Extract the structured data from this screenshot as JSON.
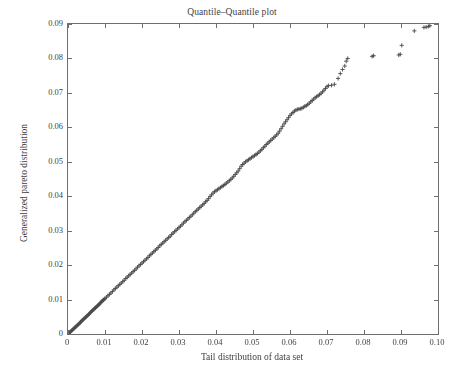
{
  "chart_data": {
    "type": "scatter",
    "title": "Quantile–Quantile plot",
    "xlabel": "Tail distribution of data set",
    "ylabel": "Generalized pareto distribution",
    "xlim": [
      0,
      0.1
    ],
    "ylim": [
      0,
      0.09
    ],
    "grid": false,
    "legend": null,
    "marker": "plus",
    "marker_color": "#4a4a4a",
    "axis_color": "#6e6e6e",
    "background": "#ffffff",
    "xticks": [
      0,
      0.01,
      0.02,
      0.03,
      0.04,
      0.05,
      0.06,
      0.07,
      0.08,
      0.09,
      0.1
    ],
    "xtick_labels": [
      "0",
      "0.01",
      "0.02",
      "0.03",
      "0.04",
      "0.05",
      "0.06",
      "0.07",
      "0.08",
      "0.09",
      "0.10"
    ],
    "yticks": [
      0,
      0.01,
      0.02,
      0.03,
      0.04,
      0.05,
      0.06,
      0.07,
      0.08,
      0.09
    ],
    "ytick_labels": [
      "0",
      "0.01",
      "0.02",
      "0.03",
      "0.04",
      "0.05",
      "0.06",
      "0.07",
      "0.08",
      "0.09"
    ],
    "series": [
      {
        "name": "quantile-pairs",
        "points": [
          [
            0.0,
            0.0
          ],
          [
            0.0002,
            0.0002
          ],
          [
            0.0004,
            0.0004
          ],
          [
            0.0006,
            0.0006
          ],
          [
            0.0008,
            0.0008
          ],
          [
            0.001,
            0.001
          ],
          [
            0.0012,
            0.0012
          ],
          [
            0.0014,
            0.0014
          ],
          [
            0.0016,
            0.0016
          ],
          [
            0.0018,
            0.0018
          ],
          [
            0.002,
            0.002
          ],
          [
            0.0022,
            0.0022
          ],
          [
            0.0024,
            0.0024
          ],
          [
            0.0026,
            0.0026
          ],
          [
            0.0028,
            0.0028
          ],
          [
            0.003,
            0.003
          ],
          [
            0.0032,
            0.0032
          ],
          [
            0.0034,
            0.0034
          ],
          [
            0.0036,
            0.0037
          ],
          [
            0.0038,
            0.0039
          ],
          [
            0.004,
            0.0041
          ],
          [
            0.0042,
            0.0043
          ],
          [
            0.0044,
            0.0045
          ],
          [
            0.0046,
            0.0047
          ],
          [
            0.0048,
            0.0049
          ],
          [
            0.005,
            0.0051
          ],
          [
            0.0052,
            0.0053
          ],
          [
            0.0054,
            0.0055
          ],
          [
            0.0056,
            0.0057
          ],
          [
            0.0058,
            0.0059
          ],
          [
            0.006,
            0.0062
          ],
          [
            0.0062,
            0.0064
          ],
          [
            0.0064,
            0.0066
          ],
          [
            0.0066,
            0.0068
          ],
          [
            0.0068,
            0.007
          ],
          [
            0.007,
            0.0072
          ],
          [
            0.0072,
            0.0074
          ],
          [
            0.0074,
            0.0076
          ],
          [
            0.0076,
            0.0078
          ],
          [
            0.0078,
            0.008
          ],
          [
            0.008,
            0.0082
          ],
          [
            0.0082,
            0.0084
          ],
          [
            0.0084,
            0.0086
          ],
          [
            0.0086,
            0.0088
          ],
          [
            0.0088,
            0.0091
          ],
          [
            0.009,
            0.0093
          ],
          [
            0.0092,
            0.0095
          ],
          [
            0.0094,
            0.0097
          ],
          [
            0.0096,
            0.0099
          ],
          [
            0.0098,
            0.0101
          ],
          [
            0.01,
            0.0103
          ],
          [
            0.0104,
            0.0107
          ],
          [
            0.0108,
            0.0111
          ],
          [
            0.0112,
            0.0115
          ],
          [
            0.0116,
            0.0119
          ],
          [
            0.012,
            0.0123
          ],
          [
            0.0124,
            0.0128
          ],
          [
            0.0128,
            0.0132
          ],
          [
            0.0132,
            0.0136
          ],
          [
            0.0136,
            0.014
          ],
          [
            0.014,
            0.0144
          ],
          [
            0.0144,
            0.0148
          ],
          [
            0.0148,
            0.0152
          ],
          [
            0.0152,
            0.0156
          ],
          [
            0.0156,
            0.0161
          ],
          [
            0.016,
            0.0165
          ],
          [
            0.0164,
            0.0169
          ],
          [
            0.0168,
            0.0173
          ],
          [
            0.0172,
            0.0177
          ],
          [
            0.0176,
            0.0181
          ],
          [
            0.018,
            0.0185
          ],
          [
            0.0184,
            0.0189
          ],
          [
            0.0188,
            0.0194
          ],
          [
            0.0192,
            0.0198
          ],
          [
            0.0196,
            0.0202
          ],
          [
            0.02,
            0.0206
          ],
          [
            0.0204,
            0.021
          ],
          [
            0.0208,
            0.0214
          ],
          [
            0.0212,
            0.0218
          ],
          [
            0.0216,
            0.0222
          ],
          [
            0.022,
            0.0227
          ],
          [
            0.0224,
            0.0231
          ],
          [
            0.0228,
            0.0235
          ],
          [
            0.0232,
            0.0239
          ],
          [
            0.0236,
            0.0243
          ],
          [
            0.024,
            0.0247
          ],
          [
            0.0244,
            0.0251
          ],
          [
            0.0248,
            0.0256
          ],
          [
            0.0252,
            0.026
          ],
          [
            0.0256,
            0.0264
          ],
          [
            0.026,
            0.0268
          ],
          [
            0.0264,
            0.0272
          ],
          [
            0.0268,
            0.0276
          ],
          [
            0.0272,
            0.028
          ],
          [
            0.0276,
            0.0284
          ],
          [
            0.028,
            0.0289
          ],
          [
            0.0284,
            0.0293
          ],
          [
            0.0288,
            0.0297
          ],
          [
            0.0292,
            0.0301
          ],
          [
            0.0296,
            0.0305
          ],
          [
            0.03,
            0.0309
          ],
          [
            0.0304,
            0.0313
          ],
          [
            0.0308,
            0.0317
          ],
          [
            0.0312,
            0.0322
          ],
          [
            0.0316,
            0.0326
          ],
          [
            0.032,
            0.033
          ],
          [
            0.0324,
            0.0334
          ],
          [
            0.0328,
            0.0338
          ],
          [
            0.0332,
            0.0342
          ],
          [
            0.0336,
            0.0346
          ],
          [
            0.034,
            0.0351
          ],
          [
            0.0344,
            0.0355
          ],
          [
            0.0348,
            0.0359
          ],
          [
            0.0352,
            0.0363
          ],
          [
            0.0356,
            0.0367
          ],
          [
            0.036,
            0.0371
          ],
          [
            0.0364,
            0.0375
          ],
          [
            0.0368,
            0.0379
          ],
          [
            0.0372,
            0.0384
          ],
          [
            0.0376,
            0.0388
          ],
          [
            0.038,
            0.0393
          ],
          [
            0.0384,
            0.0399
          ],
          [
            0.0388,
            0.0404
          ],
          [
            0.0392,
            0.0409
          ],
          [
            0.0396,
            0.0413
          ],
          [
            0.04,
            0.0416
          ],
          [
            0.0404,
            0.0419
          ],
          [
            0.0408,
            0.0422
          ],
          [
            0.0412,
            0.0425
          ],
          [
            0.0416,
            0.0428
          ],
          [
            0.042,
            0.0431
          ],
          [
            0.0424,
            0.0434
          ],
          [
            0.0428,
            0.0438
          ],
          [
            0.0432,
            0.0441
          ],
          [
            0.0436,
            0.0445
          ],
          [
            0.044,
            0.0449
          ],
          [
            0.0444,
            0.0453
          ],
          [
            0.0448,
            0.0458
          ],
          [
            0.0452,
            0.0463
          ],
          [
            0.0456,
            0.0468
          ],
          [
            0.046,
            0.0473
          ],
          [
            0.0464,
            0.048
          ],
          [
            0.0468,
            0.0487
          ],
          [
            0.0472,
            0.0492
          ],
          [
            0.0476,
            0.0496
          ],
          [
            0.048,
            0.05
          ],
          [
            0.0484,
            0.0503
          ],
          [
            0.0488,
            0.0506
          ],
          [
            0.0492,
            0.0509
          ],
          [
            0.0496,
            0.0512
          ],
          [
            0.05,
            0.0515
          ],
          [
            0.0504,
            0.0518
          ],
          [
            0.0508,
            0.0521
          ],
          [
            0.0512,
            0.0524
          ],
          [
            0.0516,
            0.0528
          ],
          [
            0.052,
            0.0532
          ],
          [
            0.0524,
            0.0536
          ],
          [
            0.0528,
            0.0541
          ],
          [
            0.0532,
            0.0545
          ],
          [
            0.0536,
            0.055
          ],
          [
            0.054,
            0.0554
          ],
          [
            0.0544,
            0.0558
          ],
          [
            0.0548,
            0.0562
          ],
          [
            0.0552,
            0.0566
          ],
          [
            0.0556,
            0.057
          ],
          [
            0.056,
            0.0574
          ],
          [
            0.0564,
            0.0578
          ],
          [
            0.0568,
            0.0583
          ],
          [
            0.0572,
            0.0589
          ],
          [
            0.0576,
            0.0596
          ],
          [
            0.058,
            0.0603
          ],
          [
            0.0584,
            0.061
          ],
          [
            0.0588,
            0.0616
          ],
          [
            0.0592,
            0.0622
          ],
          [
            0.0596,
            0.0628
          ],
          [
            0.06,
            0.0634
          ],
          [
            0.0604,
            0.0639
          ],
          [
            0.0608,
            0.0643
          ],
          [
            0.0612,
            0.0647
          ],
          [
            0.0616,
            0.065
          ],
          [
            0.062,
            0.0652
          ],
          [
            0.0624,
            0.0653
          ],
          [
            0.0628,
            0.0654
          ],
          [
            0.0632,
            0.0655
          ],
          [
            0.0636,
            0.0658
          ],
          [
            0.064,
            0.0661
          ],
          [
            0.0644,
            0.0663
          ],
          [
            0.0648,
            0.0666
          ],
          [
            0.0652,
            0.067
          ],
          [
            0.0656,
            0.0674
          ],
          [
            0.066,
            0.0678
          ],
          [
            0.0664,
            0.0682
          ],
          [
            0.0668,
            0.0686
          ],
          [
            0.0672,
            0.0689
          ],
          [
            0.0676,
            0.0692
          ],
          [
            0.068,
            0.0695
          ],
          [
            0.0684,
            0.0699
          ],
          [
            0.0688,
            0.0703
          ],
          [
            0.0692,
            0.0708
          ],
          [
            0.0696,
            0.0713
          ],
          [
            0.07,
            0.0718
          ],
          [
            0.0704,
            0.0721
          ],
          [
            0.0712,
            0.0722
          ],
          [
            0.072,
            0.0725
          ],
          [
            0.073,
            0.0742
          ],
          [
            0.0736,
            0.0756
          ],
          [
            0.0742,
            0.0768
          ],
          [
            0.0748,
            0.0778
          ],
          [
            0.0752,
            0.0792
          ],
          [
            0.0756,
            0.08
          ],
          [
            0.0822,
            0.0806
          ],
          [
            0.0826,
            0.0808
          ],
          [
            0.0894,
            0.081
          ],
          [
            0.0898,
            0.0812
          ],
          [
            0.0902,
            0.0838
          ],
          [
            0.0936,
            0.088
          ],
          [
            0.0962,
            0.089
          ],
          [
            0.0968,
            0.0891
          ],
          [
            0.0974,
            0.0893
          ],
          [
            0.0978,
            0.0895
          ]
        ]
      }
    ]
  }
}
